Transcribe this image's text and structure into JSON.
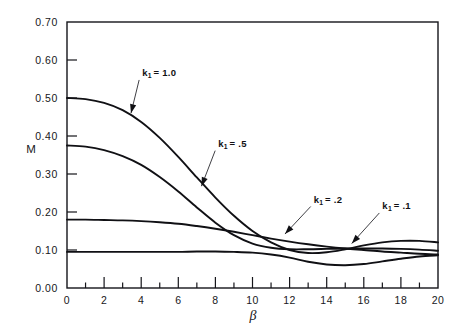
{
  "chart_data": {
    "type": "line",
    "title": "",
    "xlabel": "β",
    "ylabel": "M",
    "xlim": [
      0,
      20
    ],
    "ylim": [
      0.0,
      0.7
    ],
    "grid": false,
    "legend_position": "inline-annotations",
    "x_ticks": [
      0,
      2,
      4,
      6,
      8,
      10,
      12,
      14,
      16,
      18,
      20
    ],
    "x_tick_labels": [
      "0",
      "2",
      "4",
      "6",
      "8",
      "10",
      "12",
      "14",
      "16",
      "18",
      "20"
    ],
    "y_ticks": [
      0.0,
      0.1,
      0.2,
      0.3,
      0.4,
      0.5,
      0.6,
      0.7
    ],
    "y_tick_labels": [
      "0.00",
      "0.10",
      "0.20",
      "0.30",
      "0.40",
      "0.50",
      "0.60",
      "0.70"
    ],
    "x_minor_ticks": [
      1,
      3,
      5,
      7,
      9,
      11,
      13,
      15,
      17,
      19
    ],
    "series": [
      {
        "name": "k₁ = 1.0",
        "label_text": "k",
        "label_sub": "1",
        "label_rest": "= 1.0",
        "x": [
          0,
          1,
          2,
          3,
          4,
          5,
          6,
          7,
          8,
          9,
          10,
          11,
          12,
          13,
          14,
          15,
          16,
          17,
          18,
          19,
          20
        ],
        "values": [
          0.5,
          0.497,
          0.487,
          0.468,
          0.437,
          0.395,
          0.345,
          0.291,
          0.238,
          0.19,
          0.15,
          0.12,
          0.1,
          0.092,
          0.094,
          0.102,
          0.112,
          0.12,
          0.124,
          0.124,
          0.12
        ]
      },
      {
        "name": "k₁ = .5",
        "label_text": "k",
        "label_sub": "1",
        "label_rest": "= .5",
        "x": [
          0,
          1,
          2,
          3,
          4,
          5,
          6,
          7,
          8,
          9,
          10,
          11,
          12,
          13,
          14,
          15,
          16,
          17,
          18,
          19,
          20
        ],
        "values": [
          0.375,
          0.372,
          0.363,
          0.347,
          0.324,
          0.292,
          0.254,
          0.212,
          0.172,
          0.139,
          0.117,
          0.106,
          0.102,
          0.102,
          0.103,
          0.104,
          0.104,
          0.104,
          0.103,
          0.101,
          0.098
        ]
      },
      {
        "name": "k₁ = .2",
        "label_text": "k",
        "label_sub": "1",
        "label_rest": "= .2",
        "x": [
          0,
          1,
          2,
          3,
          4,
          5,
          6,
          7,
          8,
          9,
          10,
          11,
          12,
          13,
          14,
          15,
          16,
          17,
          18,
          19,
          20
        ],
        "values": [
          0.18,
          0.18,
          0.179,
          0.178,
          0.176,
          0.173,
          0.169,
          0.163,
          0.156,
          0.148,
          0.139,
          0.13,
          0.122,
          0.115,
          0.109,
          0.104,
          0.1,
          0.096,
          0.093,
          0.09,
          0.088
        ]
      },
      {
        "name": "k₁ = .1",
        "label_text": "k",
        "label_sub": "1",
        "label_rest": "= .1",
        "x": [
          0,
          1,
          2,
          3,
          4,
          5,
          6,
          7,
          8,
          9,
          10,
          11,
          12,
          13,
          14,
          15,
          16,
          17,
          18,
          19,
          20
        ],
        "values": [
          0.095,
          0.095,
          0.095,
          0.095,
          0.095,
          0.095,
          0.095,
          0.096,
          0.096,
          0.095,
          0.093,
          0.088,
          0.08,
          0.069,
          0.062,
          0.06,
          0.063,
          0.07,
          0.077,
          0.083,
          0.086
        ]
      }
    ],
    "annotations": [
      {
        "text": "k₁ = 1.0",
        "label_x": 4.05,
        "label_y": 0.558,
        "point_x": 3.45,
        "point_y": 0.46
      },
      {
        "text": "k₁ = .5",
        "label_x": 8.15,
        "label_y": 0.372,
        "point_x": 7.25,
        "point_y": 0.268
      },
      {
        "text": "k₁ = .2",
        "label_x": 13.3,
        "label_y": 0.225,
        "point_x": 11.75,
        "point_y": 0.142
      },
      {
        "text": "k₁ = .1",
        "label_x": 17.0,
        "label_y": 0.208,
        "point_x": 15.35,
        "point_y": 0.117
      }
    ]
  },
  "colors": {
    "ink": "#101014",
    "background": "#ffffff"
  }
}
